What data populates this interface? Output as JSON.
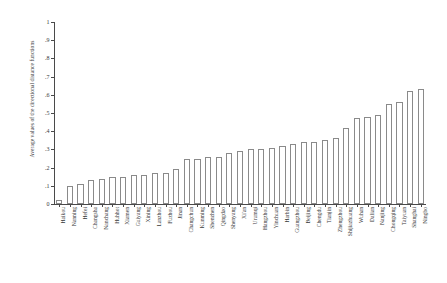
{
  "chart_data": {
    "type": "bar",
    "title": "",
    "xlabel": "",
    "ylabel": "Average values of the directional distance functions",
    "ylim": [
      0,
      1
    ],
    "ytick_labels": [
      "0",
      ".1",
      ".2",
      ".3",
      ".4",
      ".5",
      ".6",
      ".7",
      ".8",
      ".9",
      "1"
    ],
    "ytick_values": [
      0,
      0.1,
      0.2,
      0.3,
      0.4,
      0.5,
      0.6,
      0.7,
      0.8,
      0.9,
      1
    ],
    "grid": false,
    "legend": false,
    "categories": [
      "Haikou",
      "Nanning",
      "Hefei",
      "Changsha",
      "Nanchang",
      "Huhhot",
      "Xiamen",
      "Guiyang",
      "Xining",
      "Lanzhou",
      "Fuzhou",
      "Jinan",
      "Changchun",
      "Kunming",
      "Shenzhen",
      "Qingdao",
      "Shenyang",
      "Xi'an",
      "Urumqi",
      "Hangzhou",
      "Yinchuan",
      "Harbin",
      "Guangzhou",
      "Beijing",
      "Chengdu",
      "Tianjin",
      "Zhengzhou",
      "Shijiazhuang",
      "Wuhan",
      "Dalian",
      "Nanjing",
      "Chongqing",
      "Taiyuan",
      "Shanghai",
      "Ningbo"
    ],
    "values": [
      0.02,
      0.1,
      0.11,
      0.13,
      0.14,
      0.15,
      0.15,
      0.16,
      0.16,
      0.17,
      0.17,
      0.19,
      0.25,
      0.25,
      0.26,
      0.26,
      0.28,
      0.29,
      0.3,
      0.3,
      0.31,
      0.32,
      0.33,
      0.34,
      0.34,
      0.35,
      0.36,
      0.42,
      0.47,
      0.48,
      0.49,
      0.55,
      0.56,
      0.62,
      0.63
    ]
  }
}
